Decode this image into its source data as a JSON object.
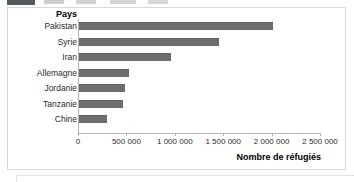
{
  "figure": {
    "panel_border_color": "#d9d9d9",
    "bar_color": "#6e6e6e",
    "axis_color": "#b5b5b5"
  },
  "top_strip": {
    "badge_name": "clipped-figure-number-badge",
    "caption_name": "clipped-figure-caption"
  },
  "chart_data": {
    "type": "bar",
    "orientation": "horizontal",
    "title": "",
    "xlabel": "Nombre de réfugiés",
    "ylabel": "Pays",
    "categories": [
      "Pakistan",
      "Syrie",
      "Iran",
      "Allemagne",
      "Jordanie",
      "Tanzanie",
      "Chine"
    ],
    "values": [
      2000000,
      1450000,
      950000,
      520000,
      480000,
      450000,
      290000
    ],
    "series": [
      {
        "name": "Nombre de réfugiés",
        "values": [
          2000000,
          1450000,
          950000,
          520000,
          480000,
          450000,
          290000
        ]
      }
    ],
    "xlim": [
      0,
      2500000
    ],
    "xticks": [
      0,
      500000,
      1000000,
      1500000,
      2000000,
      2500000
    ],
    "xticklabels": [
      "0",
      "500 000",
      "1 000 000",
      "1 500 000",
      "2 000 000",
      "2 500 000"
    ],
    "grid": false,
    "legend": false,
    "legend_position": "none"
  }
}
